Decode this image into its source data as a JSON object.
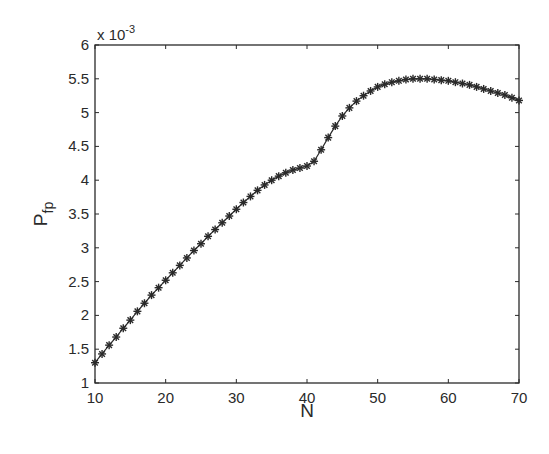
{
  "chart_data": {
    "type": "line",
    "title": "",
    "xlabel": "N",
    "ylabel": "P_fp",
    "ylabel_main": "P",
    "ylabel_sub": "fp",
    "y_multiplier": "x 10",
    "y_multiplier_exp": "-3",
    "xlim": [
      10,
      70
    ],
    "ylim": [
      1,
      6
    ],
    "grid": false,
    "legend": null,
    "marker": "asterisk",
    "line_color": "#2a2a2a",
    "xticks": [
      10,
      20,
      30,
      40,
      50,
      60,
      70
    ],
    "xtick_labels": [
      "10",
      "20",
      "30",
      "40",
      "50",
      "60",
      "70"
    ],
    "yticks": [
      1,
      1.5,
      2,
      2.5,
      3,
      3.5,
      4,
      4.5,
      5,
      5.5,
      6
    ],
    "ytick_labels": [
      "1",
      "1.5",
      "2",
      "2.5",
      "3",
      "3.5",
      "4",
      "4.5",
      "5",
      "5.5",
      "6"
    ],
    "series": [
      {
        "name": "P_fp",
        "x": [
          10,
          11,
          12,
          13,
          14,
          15,
          16,
          17,
          18,
          19,
          20,
          21,
          22,
          23,
          24,
          25,
          26,
          27,
          28,
          29,
          30,
          31,
          32,
          33,
          34,
          35,
          36,
          37,
          38,
          39,
          40,
          41,
          42,
          43,
          44,
          45,
          46,
          47,
          48,
          49,
          50,
          51,
          52,
          53,
          54,
          55,
          56,
          57,
          58,
          59,
          60,
          61,
          62,
          63,
          64,
          65,
          66,
          67,
          68,
          69,
          70
        ],
        "values": [
          1.3,
          1.43,
          1.56,
          1.68,
          1.81,
          1.93,
          2.06,
          2.18,
          2.3,
          2.41,
          2.52,
          2.63,
          2.74,
          2.85,
          2.96,
          3.06,
          3.17,
          3.27,
          3.37,
          3.47,
          3.57,
          3.67,
          3.76,
          3.85,
          3.93,
          4.0,
          4.06,
          4.11,
          4.15,
          4.18,
          4.21,
          4.28,
          4.45,
          4.63,
          4.8,
          4.95,
          5.07,
          5.17,
          5.25,
          5.32,
          5.38,
          5.42,
          5.45,
          5.47,
          5.49,
          5.5,
          5.5,
          5.5,
          5.49,
          5.48,
          5.47,
          5.45,
          5.43,
          5.41,
          5.38,
          5.35,
          5.32,
          5.29,
          5.26,
          5.22,
          5.18
        ]
      }
    ]
  }
}
